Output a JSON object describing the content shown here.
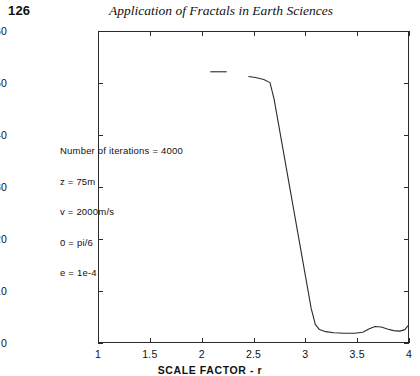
{
  "header": {
    "folio": "126",
    "running_title": "Application of Fractals in Earth Sciences"
  },
  "chart_data": {
    "type": "line",
    "title": "",
    "xlabel": "SCALE FACTOR - r",
    "ylabel": "LOSS OF INFORMATION  I",
    "xlim": [
      1,
      4
    ],
    "ylim": [
      0,
      60
    ],
    "xticks": [
      "1",
      "1.5",
      "2",
      "2.5",
      "3",
      "3.5",
      "4"
    ],
    "xtick_values": [
      1,
      1.5,
      2,
      2.5,
      3,
      3.5,
      4
    ],
    "yticks": [
      "0",
      "10",
      "20",
      "30",
      "40",
      "50",
      "60"
    ],
    "ytick_values": [
      0,
      10,
      20,
      30,
      40,
      50,
      60
    ],
    "grid": false,
    "legend": "none",
    "line_color": "#2b2b2b",
    "series": [
      {
        "name": "loss-of-information",
        "note": "leading detached plateau segment",
        "x": [
          2.08,
          2.24
        ],
        "values": [
          52.3,
          52.3
        ]
      },
      {
        "name": "loss-of-information-main",
        "x": [
          2.45,
          2.52,
          2.6,
          2.66,
          2.7,
          2.74,
          2.78,
          2.82,
          2.86,
          2.9,
          2.94,
          2.98,
          3.02,
          3.06,
          3.1,
          3.14,
          3.2,
          3.28,
          3.38,
          3.48,
          3.56,
          3.62,
          3.68,
          3.74,
          3.8,
          3.86,
          3.92,
          3.97,
          4.0
        ],
        "values": [
          51.4,
          51.2,
          50.8,
          50.2,
          47.0,
          42.5,
          38.0,
          33.5,
          29.0,
          24.5,
          20.0,
          15.5,
          11.0,
          6.5,
          3.4,
          2.4,
          2.0,
          1.8,
          1.7,
          1.7,
          1.9,
          2.5,
          3.0,
          2.9,
          2.5,
          2.2,
          2.1,
          2.4,
          3.2
        ]
      }
    ],
    "annotations": [
      "Number of iterations = 4000",
      "z = 75m",
      "v = 2000m/s",
      "0 = pi/6",
      "e = 1e-4"
    ]
  }
}
